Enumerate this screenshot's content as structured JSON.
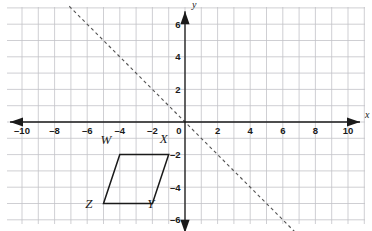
{
  "figure": {
    "background_color": "#ffffff",
    "grid_color": "#c3c3c8",
    "axis_color": "#1a1a1a",
    "shape_color": "#1a1a1a",
    "dashed_line_color": "#555555"
  },
  "chart_data": {
    "type": "scatter",
    "title": "",
    "xlabel": "x",
    "ylabel": "y",
    "xlim": [
      -10.8,
      10.8
    ],
    "ylim": [
      -7.2,
      7.2
    ],
    "grid": true,
    "grid_step": 1,
    "legend": "none",
    "axis_labels": {
      "x": "x",
      "y": "y"
    },
    "x_ticks": [
      -10,
      -8,
      -6,
      -4,
      -2,
      0,
      2,
      4,
      6,
      8,
      10
    ],
    "x_tick_labels": [
      "–10",
      "–8",
      "–6",
      "–4",
      "–2",
      "0",
      "2",
      "4",
      "6",
      "8",
      "10"
    ],
    "y_ticks": [
      6,
      4,
      2,
      -2,
      -4,
      -6
    ],
    "y_tick_labels": [
      "6",
      "4",
      "2",
      "–2",
      "–4",
      "–6"
    ],
    "origin_label": "0",
    "series": [
      {
        "name": "Parallelogram WXYZ",
        "type": "polygon",
        "closed": true,
        "style": "solid",
        "points": [
          {
            "label": "W",
            "x": -4,
            "y": -2,
            "label_dx": -0.85,
            "label_dy": 0.62
          },
          {
            "label": "X",
            "x": -1,
            "y": -2,
            "label_dx": -0.3,
            "label_dy": 0.7
          },
          {
            "label": "Y",
            "x": -2,
            "y": -5,
            "label_dx": -0.1,
            "label_dy": -0.28
          },
          {
            "label": "Z",
            "x": -5,
            "y": -5,
            "label_dx": -0.9,
            "label_dy": -0.25
          }
        ]
      },
      {
        "name": "Dashed line y = -x",
        "type": "line",
        "style": "dashed",
        "slope": -1,
        "intercept": 0,
        "endpoints": [
          {
            "x": -7.1,
            "y": 7.1
          },
          {
            "x": 8.1,
            "y": -8.1
          }
        ]
      }
    ]
  }
}
